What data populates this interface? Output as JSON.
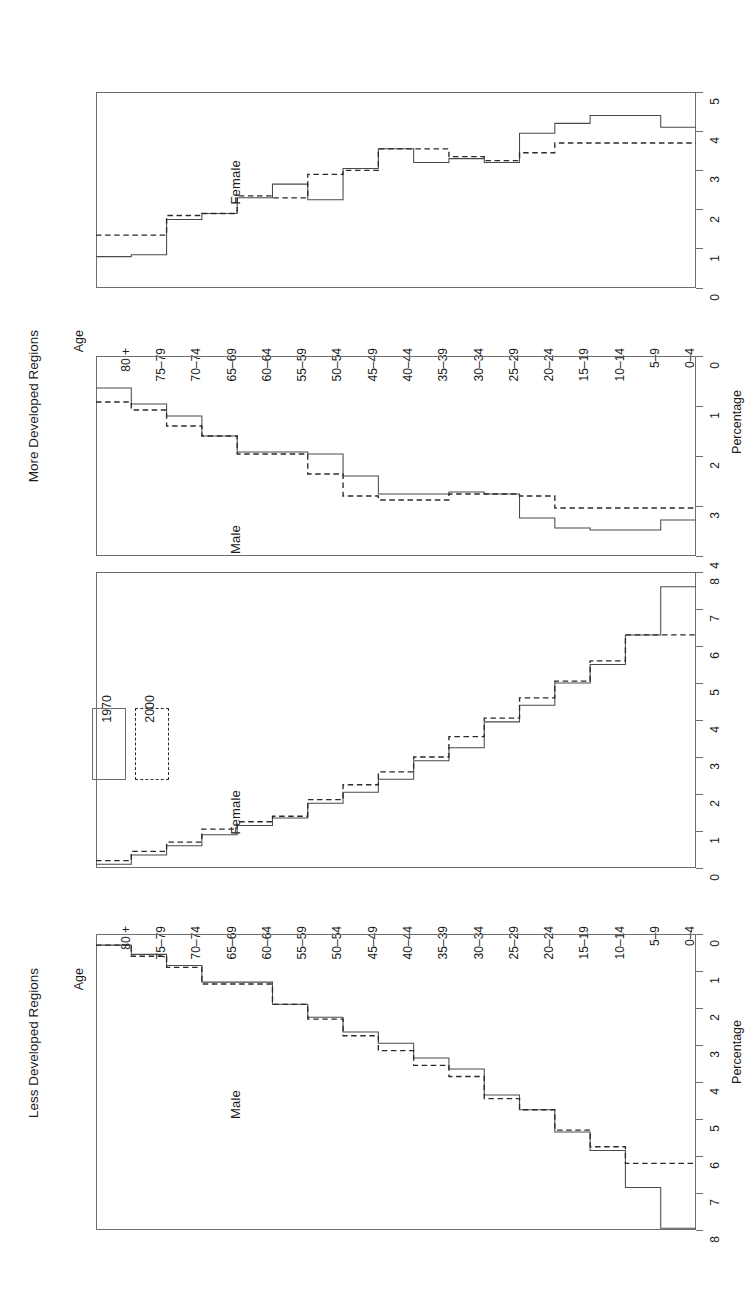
{
  "figure": {
    "orientation": "rotated-90-clockwise",
    "age_axis_label": "Age",
    "percentage_axis_label": "Percentage",
    "legend": {
      "items": [
        {
          "label": "1970",
          "style": "solid"
        },
        {
          "label": "2000",
          "style": "dashed"
        }
      ]
    },
    "panels": [
      {
        "group_title": "More Developed Regions",
        "male_label": "Male",
        "female_label": "Female",
        "male_axis_ticks": [
          "0",
          "1",
          "2",
          "3",
          "4"
        ],
        "female_axis_ticks": [
          "0",
          "1",
          "2",
          "3",
          "4",
          "5"
        ]
      },
      {
        "group_title": "Less Developed Regions",
        "male_label": "Male",
        "female_label": "Female",
        "male_axis_ticks": [
          "0",
          "1",
          "2",
          "3",
          "4",
          "5",
          "6",
          "7",
          "8"
        ],
        "female_axis_ticks": [
          "0",
          "1",
          "2",
          "3",
          "4",
          "5",
          "6",
          "7",
          "8"
        ]
      }
    ]
  },
  "age_groups": [
    "80 +",
    "75–79",
    "70–74",
    "65–69",
    "60–64",
    "55–59",
    "50–54",
    "45–49",
    "40–44",
    "35–39",
    "30–34",
    "25–29",
    "20–24",
    "15–19",
    "10–14",
    "5–9",
    "0–4"
  ],
  "colors": {
    "axis": "#6f6f6f",
    "series_1970": "#4a4a4a",
    "series_2000": "#2b2b2b",
    "text": "#1a1a1a",
    "background": "#ffffff"
  },
  "chart_data": [
    {
      "type": "bar",
      "title": "More Developed Regions",
      "subtitle": "Male",
      "xlabel": "Age",
      "ylabel": "Percentage",
      "xlim": [
        0,
        5
      ],
      "axis_reversed": true,
      "categories": [
        "80 +",
        "75–79",
        "70–74",
        "65–69",
        "60–64",
        "55–59",
        "50–54",
        "45–49",
        "40–44",
        "35–39",
        "30–34",
        "25–29",
        "20–24",
        "15–19",
        "10–14",
        "5–9",
        "0–4"
      ],
      "series": [
        {
          "name": "1970",
          "style": "solid",
          "values": [
            0.8,
            1.2,
            1.5,
            2.0,
            2.4,
            2.4,
            2.45,
            3.0,
            3.45,
            3.45,
            3.4,
            3.45,
            4.05,
            4.3,
            4.35,
            4.35,
            4.1
          ]
        },
        {
          "name": "2000",
          "style": "dashed",
          "values": [
            1.15,
            1.35,
            1.75,
            2.0,
            2.45,
            2.45,
            2.95,
            3.5,
            3.6,
            3.6,
            3.45,
            3.45,
            3.5,
            3.8,
            3.8,
            3.8,
            3.8
          ]
        }
      ],
      "legend_position": "upper-left",
      "grid": false
    },
    {
      "type": "bar",
      "title": "More Developed Regions",
      "subtitle": "Female",
      "xlabel": "Age",
      "ylabel": "Percentage",
      "xlim": [
        0,
        5
      ],
      "axis_reversed": false,
      "categories": [
        "80 +",
        "75–79",
        "70–74",
        "65–69",
        "60–64",
        "55–59",
        "50–54",
        "45–49",
        "40–44",
        "35–39",
        "30–34",
        "25–29",
        "20–24",
        "15–19",
        "10–14",
        "5–9",
        "0–4"
      ],
      "series": [
        {
          "name": "1970",
          "style": "solid",
          "values": [
            0.8,
            0.85,
            1.75,
            1.9,
            2.3,
            2.65,
            2.25,
            3.05,
            3.55,
            3.2,
            3.3,
            3.2,
            3.95,
            4.2,
            4.4,
            4.4,
            4.1
          ]
        },
        {
          "name": "2000",
          "style": "dashed",
          "values": [
            1.35,
            1.35,
            1.85,
            1.9,
            2.35,
            2.3,
            2.9,
            3.0,
            3.55,
            3.55,
            3.35,
            3.25,
            3.45,
            3.7,
            3.7,
            3.7,
            3.7
          ]
        }
      ],
      "legend_position": "upper-left",
      "grid": false
    },
    {
      "type": "bar",
      "title": "Less Developed Regions",
      "subtitle": "Male",
      "xlabel": "Age",
      "ylabel": "Percentage",
      "xlim": [
        0,
        8
      ],
      "axis_reversed": true,
      "categories": [
        "80 +",
        "75–79",
        "70–74",
        "65–69",
        "60–64",
        "55–59",
        "50–54",
        "45–49",
        "40–44",
        "35–39",
        "30–34",
        "25–29",
        "20–24",
        "15–19",
        "10–14",
        "5–9",
        "0–4"
      ],
      "series": [
        {
          "name": "1970",
          "style": "solid",
          "values": [
            0.3,
            0.55,
            0.85,
            1.3,
            1.3,
            1.9,
            2.25,
            2.65,
            2.95,
            3.35,
            3.65,
            4.35,
            4.75,
            5.35,
            5.85,
            6.85,
            7.95
          ]
        },
        {
          "name": "2000",
          "style": "dashed",
          "values": [
            0.3,
            0.6,
            0.9,
            1.35,
            1.35,
            1.9,
            2.3,
            2.75,
            3.15,
            3.55,
            3.85,
            4.45,
            4.75,
            5.3,
            5.75,
            6.2,
            6.2
          ]
        }
      ],
      "legend_position": "upper-left",
      "grid": false
    },
    {
      "type": "bar",
      "title": "Less Developed Regions",
      "subtitle": "Female",
      "xlabel": "Age",
      "ylabel": "Percentage",
      "xlim": [
        0,
        8
      ],
      "axis_reversed": false,
      "categories": [
        "80 +",
        "75–79",
        "70–74",
        "65–69",
        "60–64",
        "55–59",
        "50–54",
        "45–49",
        "40–44",
        "35–39",
        "30–34",
        "25–29",
        "20–24",
        "15–19",
        "10–14",
        "5–9",
        "0–4"
      ],
      "series": [
        {
          "name": "1970",
          "style": "solid",
          "values": [
            0.1,
            0.35,
            0.6,
            0.9,
            1.15,
            1.35,
            1.75,
            2.05,
            2.4,
            2.9,
            3.25,
            3.95,
            4.4,
            5.0,
            5.5,
            6.3,
            7.6
          ]
        },
        {
          "name": "2000",
          "style": "dashed",
          "values": [
            0.2,
            0.45,
            0.7,
            1.05,
            1.25,
            1.4,
            1.85,
            2.25,
            2.6,
            3.0,
            3.55,
            4.05,
            4.6,
            5.05,
            5.6,
            6.3,
            6.3
          ]
        }
      ],
      "legend_position": "upper-left",
      "grid": false
    }
  ]
}
